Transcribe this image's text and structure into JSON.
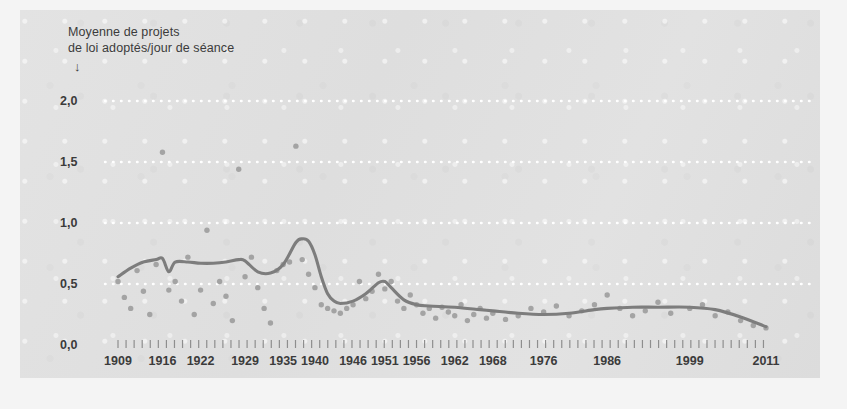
{
  "figure": {
    "background_color": "#f4f4f4",
    "panel_color": "#e0e0e0",
    "title_lines": "Moyenne de projets\nde loi adoptés/jour de séance",
    "arrow_glyph": "↓"
  },
  "colors": {
    "trend_line": "#7d7d7d",
    "scatter_point": "#9b9b9b",
    "gridline": "#ffffff",
    "tick_mark": "#8e8e8e",
    "text": "#3b3b3b"
  },
  "chart_data": {
    "type": "scatter",
    "title": "Moyenne de projets de loi adoptés/jour de séance",
    "xlabel": "",
    "ylabel": "Moyenne de projets de loi adoptés/jour de séance",
    "xlim": [
      1909,
      2011
    ],
    "ylim": [
      0.0,
      2.0
    ],
    "grid": true,
    "legend": "none",
    "ytick_labels": [
      "0,0",
      "0,5",
      "1,0",
      "1,5",
      "2,0"
    ],
    "ytick_values": [
      0.0,
      0.5,
      1.0,
      1.5,
      2.0
    ],
    "xtick_labels": [
      "1909",
      "1916",
      "1922",
      "1929",
      "1935",
      "1940",
      "1946",
      "1951",
      "1956",
      "1962",
      "1968",
      "1976",
      "1986",
      "1999",
      "2011"
    ],
    "xtick_values": [
      1909,
      1916,
      1922,
      1929,
      1935,
      1940,
      1946,
      1951,
      1956,
      1962,
      1968,
      1976,
      1986,
      1999,
      2011
    ],
    "series": [
      {
        "name": "Moyenne annuelle (points)",
        "type": "scatter",
        "marker": "circle",
        "x": [
          1909,
          1910,
          1911,
          1912,
          1913,
          1914,
          1915,
          1916,
          1917,
          1918,
          1919,
          1920,
          1921,
          1922,
          1923,
          1924,
          1925,
          1926,
          1927,
          1928,
          1929,
          1930,
          1931,
          1932,
          1933,
          1934,
          1935,
          1936,
          1937,
          1938,
          1939,
          1940,
          1941,
          1942,
          1943,
          1944,
          1945,
          1946,
          1947,
          1948,
          1949,
          1950,
          1951,
          1952,
          1953,
          1954,
          1955,
          1956,
          1957,
          1958,
          1959,
          1960,
          1961,
          1962,
          1963,
          1964,
          1965,
          1966,
          1967,
          1968,
          1970,
          1972,
          1974,
          1976,
          1978,
          1980,
          1982,
          1984,
          1986,
          1988,
          1990,
          1992,
          1994,
          1996,
          1999,
          2001,
          2003,
          2005,
          2007,
          2009,
          2011
        ],
        "y": [
          0.52,
          0.39,
          0.3,
          0.61,
          0.44,
          0.25,
          0.66,
          1.58,
          0.45,
          0.52,
          0.36,
          0.72,
          0.25,
          0.45,
          0.94,
          0.34,
          0.52,
          0.4,
          0.2,
          1.44,
          0.56,
          0.72,
          0.47,
          0.3,
          0.18,
          0.61,
          0.66,
          0.68,
          1.63,
          0.7,
          0.58,
          0.47,
          0.33,
          0.3,
          0.28,
          0.26,
          0.3,
          0.33,
          0.52,
          0.38,
          0.44,
          0.58,
          0.46,
          0.52,
          0.36,
          0.3,
          0.41,
          0.33,
          0.26,
          0.3,
          0.22,
          0.31,
          0.27,
          0.24,
          0.33,
          0.2,
          0.25,
          0.3,
          0.22,
          0.26,
          0.21,
          0.24,
          0.3,
          0.27,
          0.32,
          0.24,
          0.28,
          0.33,
          0.41,
          0.3,
          0.24,
          0.28,
          0.35,
          0.26,
          0.3,
          0.33,
          0.24,
          0.27,
          0.2,
          0.16,
          0.14
        ]
      },
      {
        "name": "Tendance lissée",
        "type": "line",
        "x": [
          1909,
          1911,
          1913,
          1915,
          1916,
          1917,
          1918,
          1920,
          1922,
          1924,
          1926,
          1928,
          1929,
          1931,
          1933,
          1935,
          1937,
          1938,
          1939,
          1940,
          1941,
          1942,
          1943,
          1944,
          1946,
          1948,
          1950,
          1951,
          1952,
          1954,
          1956,
          1958,
          1962,
          1966,
          1968,
          1972,
          1976,
          1980,
          1984,
          1986,
          1990,
          1994,
          1999,
          2003,
          2007,
          2011
        ],
        "y": [
          0.56,
          0.63,
          0.68,
          0.7,
          0.71,
          0.6,
          0.68,
          0.68,
          0.67,
          0.67,
          0.68,
          0.7,
          0.69,
          0.6,
          0.59,
          0.66,
          0.84,
          0.87,
          0.85,
          0.74,
          0.56,
          0.42,
          0.36,
          0.34,
          0.36,
          0.42,
          0.51,
          0.52,
          0.47,
          0.37,
          0.33,
          0.32,
          0.31,
          0.29,
          0.28,
          0.26,
          0.25,
          0.26,
          0.29,
          0.3,
          0.31,
          0.31,
          0.31,
          0.29,
          0.23,
          0.15
        ]
      }
    ]
  }
}
